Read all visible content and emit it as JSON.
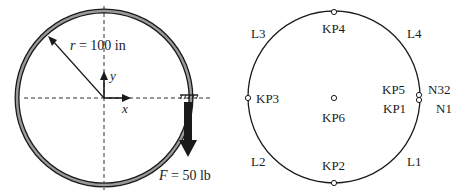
{
  "left_figure": {
    "radius_label": "r = 100 in",
    "radius_var": "r",
    "radius_eq": " = 100 in",
    "axis_x": "x",
    "axis_y": "y",
    "force_var": "F",
    "force_eq": " = 50 lb",
    "force_label": "F = 50 lb"
  },
  "right_figure": {
    "keypoints": [
      {
        "id": "KP1",
        "label": "KP1"
      },
      {
        "id": "KP2",
        "label": "KP2"
      },
      {
        "id": "KP3",
        "label": "KP3"
      },
      {
        "id": "KP4",
        "label": "KP4"
      },
      {
        "id": "KP5",
        "label": "KP5"
      },
      {
        "id": "KP6",
        "label": "KP6"
      }
    ],
    "lines": [
      {
        "id": "L1",
        "label": "L1"
      },
      {
        "id": "L2",
        "label": "L2"
      },
      {
        "id": "L3",
        "label": "L3"
      },
      {
        "id": "L4",
        "label": "L4"
      }
    ],
    "nodes": [
      {
        "id": "N1",
        "label": "N1"
      },
      {
        "id": "N32",
        "label": "N32"
      }
    ]
  },
  "colors": {
    "stroke": "#1a1a1a",
    "ring_fill": "#8a8a8a",
    "background": "#ffffff"
  }
}
